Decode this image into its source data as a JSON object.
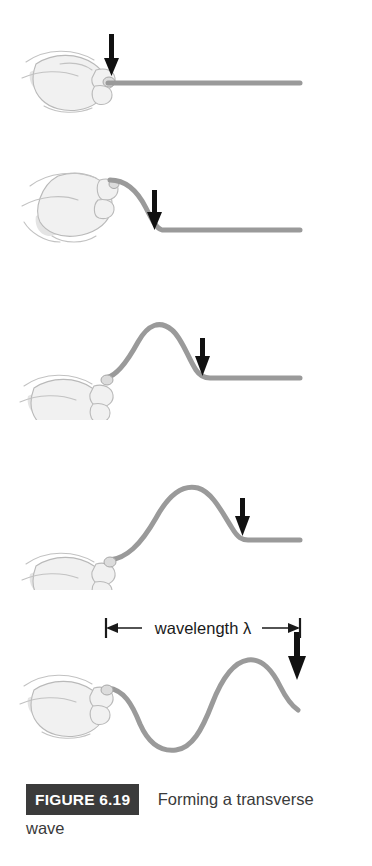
{
  "figure": {
    "badge_label": "FIGURE 6.19",
    "caption_line1": "Forming a transverse",
    "caption_line2": "wave",
    "background_color": "#ffffff",
    "rope_color": "#9a9a9a",
    "arrow_color": "#111111",
    "badge_background": "#3b3b3b",
    "badge_text_color": "#ffffff"
  },
  "annotations": {
    "wavelength_label": "wavelength λ",
    "wavelength_symbol": "λ"
  },
  "panels": [
    {
      "index": 1,
      "name": "panel-rope-flat",
      "description": "Hand grips rope at left, rope lies flat and straight to the right",
      "arrow_direction": "down",
      "arrow_x": 112,
      "rope_state": "flat"
    },
    {
      "index": 2,
      "name": "panel-hand-raised",
      "description": "Hand raised upward, rope bends down from hand to flat section",
      "arrow_direction": "down",
      "arrow_x": 155,
      "rope_state": "leading-edge"
    },
    {
      "index": 3,
      "name": "panel-pulse-formed",
      "description": "Hand lowered, a single crest pulse has formed and travels right",
      "arrow_direction": "down",
      "arrow_x": 203,
      "rope_state": "single-crest"
    },
    {
      "index": 4,
      "name": "panel-pulse-travelling",
      "description": "Crest pulse has moved further right along the rope",
      "arrow_direction": "down",
      "arrow_x": 243,
      "rope_state": "single-crest-shifted"
    },
    {
      "index": 5,
      "name": "panel-full-wave",
      "description": "Full wave with trough and crest, wavelength marked across one cycle",
      "arrow_direction": "down",
      "arrow_x": 297,
      "rope_state": "full-wave"
    }
  ]
}
